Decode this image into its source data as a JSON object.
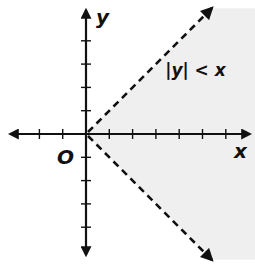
{
  "chart_data": {
    "type": "area",
    "title": "",
    "xlabel": "x",
    "ylabel": "y",
    "origin_label": "O",
    "xlim": [
      -3.5,
      7
    ],
    "ylim": [
      -5.4,
      5.4
    ],
    "x_ticks": [
      -2,
      -1,
      1,
      2,
      3,
      4,
      5,
      6
    ],
    "y_ticks": [
      -4,
      -3,
      -2,
      -1,
      1,
      2,
      3,
      4
    ],
    "grid": false,
    "inequality": "|y| < x",
    "annotation": {
      "text": "|y| < x",
      "x": 4,
      "y": 2.5
    },
    "boundaries": [
      {
        "name": "y = x",
        "style": "dashed",
        "from": [
          0,
          0
        ],
        "to": [
          5.4,
          5.4
        ]
      },
      {
        "name": "y = -x",
        "style": "dashed",
        "from": [
          0,
          0
        ],
        "to": [
          5.4,
          -5.4
        ]
      }
    ],
    "shaded_region": "right of origin between y = x and y = -x",
    "colors": {
      "shade": "#efefef",
      "ink": "#111111"
    }
  }
}
